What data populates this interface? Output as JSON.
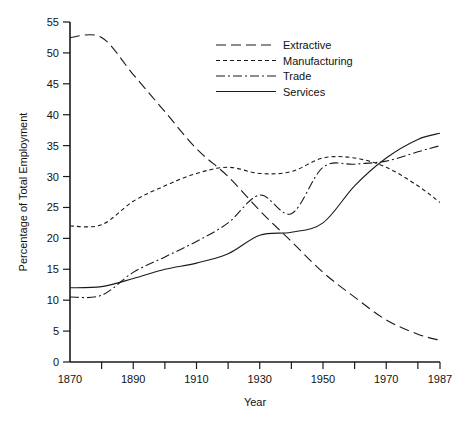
{
  "chart_data": {
    "type": "line",
    "title": "",
    "xlabel": "Year",
    "ylabel": "Percentage of Total Employment",
    "xlim": [
      1870,
      1987
    ],
    "ylim": [
      0,
      55
    ],
    "ytick_step": 5,
    "yticks": [
      0,
      5,
      10,
      15,
      20,
      25,
      30,
      35,
      40,
      45,
      50,
      55
    ],
    "ytick_labels": [
      "0",
      "5",
      "10",
      "15",
      "20",
      "25",
      "30",
      "35",
      "40",
      "45",
      "50",
      "55"
    ],
    "xticks": [
      1870,
      1880,
      1890,
      1900,
      1910,
      1920,
      1930,
      1940,
      1950,
      1960,
      1970,
      1980,
      1987
    ],
    "xtick_labels_shown": [
      "1870",
      "1890",
      "1910",
      "1930",
      "1950",
      "1970",
      "1987"
    ],
    "xtick_labeled_values": [
      1870,
      1890,
      1910,
      1930,
      1950,
      1970,
      1987
    ],
    "grid": false,
    "legend_position": "top-center-right",
    "line_color": "#1a1a1a",
    "series": [
      {
        "name": "Extractive",
        "dash": "10,5",
        "x": [
          1870,
          1880,
          1890,
          1900,
          1910,
          1920,
          1930,
          1940,
          1950,
          1960,
          1970,
          1980,
          1987
        ],
        "values": [
          52.5,
          52.5,
          46.5,
          40.5,
          34.5,
          30.0,
          24.5,
          19.5,
          14.5,
          10.5,
          6.8,
          4.5,
          3.5
        ]
      },
      {
        "name": "Manufacturing",
        "dash": "4,3",
        "x": [
          1870,
          1880,
          1890,
          1900,
          1910,
          1920,
          1930,
          1940,
          1950,
          1960,
          1970,
          1980,
          1987
        ],
        "values": [
          22.0,
          22.2,
          26.0,
          28.5,
          30.5,
          31.5,
          30.5,
          30.8,
          33.0,
          33.0,
          31.5,
          28.5,
          25.8
        ]
      },
      {
        "name": "Trade",
        "dash": "9,3,2,3",
        "x": [
          1870,
          1880,
          1890,
          1900,
          1910,
          1920,
          1930,
          1940,
          1950,
          1960,
          1970,
          1980,
          1987
        ],
        "values": [
          10.5,
          10.8,
          14.5,
          17.0,
          19.5,
          22.5,
          27.0,
          24.0,
          31.5,
          32.0,
          32.5,
          34.0,
          35.0
        ]
      },
      {
        "name": "Services",
        "dash": "none",
        "x": [
          1870,
          1880,
          1890,
          1900,
          1910,
          1920,
          1930,
          1940,
          1950,
          1960,
          1970,
          1980,
          1987
        ],
        "values": [
          12.0,
          12.2,
          13.5,
          15.0,
          16.0,
          17.5,
          20.5,
          21.0,
          22.5,
          28.5,
          33.0,
          36.0,
          37.0
        ]
      }
    ]
  },
  "legend": {
    "items": [
      {
        "label": "Extractive"
      },
      {
        "label": "Manufacturing"
      },
      {
        "label": "Trade"
      },
      {
        "label": "Services"
      }
    ]
  },
  "axes": {
    "x_title": "Year",
    "y_title": "Percentage of Total Employment"
  }
}
